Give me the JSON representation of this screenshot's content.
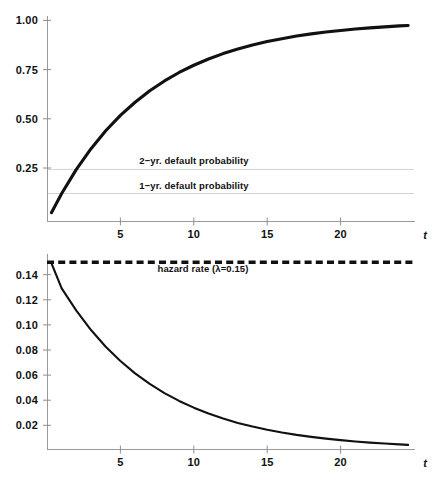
{
  "chart_data": [
    {
      "id": "cumulative-default-probability",
      "type": "line",
      "title": "",
      "xlabel": "t",
      "ylabel": "",
      "xlim": [
        0,
        25
      ],
      "ylim": [
        0,
        1.04
      ],
      "xticks": [
        5,
        10,
        15,
        20
      ],
      "xtick_labels": [
        "5",
        "10",
        "15",
        "20"
      ],
      "yticks": [
        0.25,
        0.5,
        0.75,
        1.0
      ],
      "ytick_labels": [
        "0.25",
        "0.50",
        "0.75",
        "1.00"
      ],
      "grid": false,
      "legend": "none",
      "series": [
        {
          "name": "cumulative default probability",
          "formula": "1 - exp(-0.15 t)",
          "x": [
            0.3,
            1,
            2,
            3,
            4,
            5,
            6,
            7,
            8,
            9,
            10,
            11,
            12,
            13,
            14,
            15,
            16,
            17,
            18,
            19,
            20,
            21,
            22,
            23,
            24,
            24.6
          ],
          "y": [
            0.044,
            0.139,
            0.259,
            0.362,
            0.451,
            0.528,
            0.593,
            0.65,
            0.699,
            0.741,
            0.777,
            0.808,
            0.835,
            0.858,
            0.878,
            0.895,
            0.909,
            0.922,
            0.933,
            0.942,
            0.95,
            0.957,
            0.963,
            0.968,
            0.973,
            0.975
          ]
        }
      ],
      "reference_lines": [
        {
          "name": "2-yr default probability",
          "label": "2−yr. default probability",
          "value": 0.259,
          "label_x": 10.0,
          "style": "solid-light"
        },
        {
          "name": "1-yr default probability",
          "label": "1−yr. default probability",
          "value": 0.139,
          "label_x": 10.0,
          "style": "solid-light"
        }
      ]
    },
    {
      "id": "unconditional-default-density",
      "type": "line",
      "title": "",
      "xlabel": "t",
      "ylabel": "",
      "xlim": [
        0,
        25
      ],
      "ylim": [
        0,
        0.158
      ],
      "xticks": [
        5,
        10,
        15,
        20
      ],
      "xtick_labels": [
        "5",
        "10",
        "15",
        "20"
      ],
      "yticks": [
        0.02,
        0.04,
        0.06,
        0.08,
        0.1,
        0.12,
        0.14
      ],
      "ytick_labels": [
        "0.02",
        "0.04",
        "0.06",
        "0.08",
        "0.10",
        "0.12",
        "0.14"
      ],
      "grid": false,
      "legend": "none",
      "series": [
        {
          "name": "unconditional default probability density",
          "formula": "0.15 exp(-0.15 t)",
          "x": [
            0.3,
            1,
            2,
            3,
            4,
            5,
            6,
            7,
            8,
            9,
            10,
            11,
            12,
            13,
            14,
            15,
            16,
            17,
            18,
            19,
            20,
            21,
            22,
            23,
            24,
            24.6
          ],
          "y": [
            0.1493,
            0.1291,
            0.1112,
            0.0957,
            0.0823,
            0.0709,
            0.061,
            0.0525,
            0.0452,
            0.0389,
            0.0335,
            0.0288,
            0.0248,
            0.0213,
            0.0184,
            0.0158,
            0.0136,
            0.0117,
            0.0101,
            0.0087,
            0.0075,
            0.0064,
            0.0055,
            0.0048,
            0.0041,
            0.0037
          ]
        }
      ],
      "reference_lines": [
        {
          "name": "hazard rate",
          "label": "hazard rate (λ=0.15)",
          "value": 0.15,
          "label_x": 10.6,
          "style": "dashed-bold"
        }
      ]
    }
  ],
  "colors": {
    "curve": "#111111",
    "axis": "#9a9a9a",
    "reference_light": "#d2d2d2",
    "text": "#111111",
    "background": "#ffffff"
  }
}
